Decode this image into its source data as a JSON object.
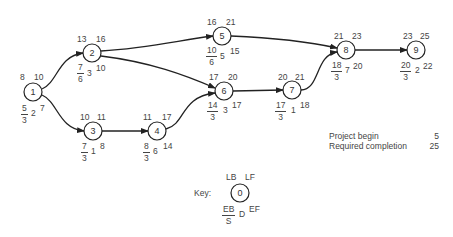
{
  "diagram": {
    "type": "activity-network",
    "nodes": [
      {
        "id": "1",
        "x": 33,
        "y": 92,
        "lb": "8",
        "lf": "10",
        "eb": "5",
        "s": "3",
        "d": "2",
        "ef": "7"
      },
      {
        "id": "2",
        "x": 92,
        "y": 53,
        "lb": "13",
        "lf": "16",
        "eb": "7",
        "s": "6",
        "d": "3",
        "ef": "10"
      },
      {
        "id": "3",
        "x": 93,
        "y": 131,
        "lb": "10",
        "lf": "11",
        "eb": "7",
        "s": "3",
        "d": "1",
        "ef": "8"
      },
      {
        "id": "4",
        "x": 157,
        "y": 131,
        "lb": "11",
        "lf": "17",
        "eb": "8",
        "s": "3",
        "d": "6",
        "ef": "14"
      },
      {
        "id": "5",
        "x": 222,
        "y": 36,
        "lb": "16",
        "lf": "21",
        "eb": "10",
        "s": "6",
        "d": "5",
        "ef": "15"
      },
      {
        "id": "6",
        "x": 224,
        "y": 91,
        "lb": "17",
        "lf": "20",
        "eb": "14",
        "s": "3",
        "d": "3",
        "ef": "17"
      },
      {
        "id": "7",
        "x": 292,
        "y": 90,
        "lb": "20",
        "lf": "21",
        "eb": "17",
        "s": "3",
        "d": "1",
        "ef": "18"
      },
      {
        "id": "8",
        "x": 346,
        "y": 50,
        "lb": "21",
        "lf": "23",
        "eb": "18",
        "s": "3",
        "d": "2",
        "ef": "20"
      },
      {
        "id": "9",
        "x": 416,
        "y": 50,
        "lb": "23",
        "lf": "25",
        "eb": "20",
        "s": "3",
        "d": "2",
        "ef": "22"
      }
    ],
    "edges": [
      {
        "from": "1",
        "to": "2"
      },
      {
        "from": "1",
        "to": "3"
      },
      {
        "from": "2",
        "to": "5"
      },
      {
        "from": "2",
        "to": "6"
      },
      {
        "from": "3",
        "to": "4"
      },
      {
        "from": "4",
        "to": "6"
      },
      {
        "from": "6",
        "to": "7"
      },
      {
        "from": "5",
        "to": "8"
      },
      {
        "from": "7",
        "to": "8"
      },
      {
        "from": "8",
        "to": "9"
      }
    ]
  },
  "node_values": {
    "n1": {
      "id": "1",
      "lb": "8",
      "lf": "10",
      "eb": "5",
      "s": "3",
      "d": "2",
      "ef": "7"
    },
    "n2": {
      "id": "2",
      "lb": "13",
      "lf": "16",
      "eb": "7",
      "s": "6",
      "d": "3",
      "ef": "10"
    },
    "n3": {
      "id": "3",
      "lb": "10",
      "lf": "11",
      "eb": "7",
      "s": "3",
      "d": "1",
      "ef": "8"
    },
    "n4": {
      "id": "4",
      "lb": "11",
      "lf": "17",
      "eb": "8",
      "s": "3",
      "d": "6",
      "ef": "14"
    },
    "n5": {
      "id": "5",
      "lb": "16",
      "lf": "21",
      "eb": "10",
      "s": "6",
      "d": "5",
      "ef": "15"
    },
    "n6": {
      "id": "6",
      "lb": "17",
      "lf": "20",
      "eb": "14",
      "s": "3",
      "d": "3",
      "ef": "17"
    },
    "n7": {
      "id": "7",
      "lb": "20",
      "lf": "21",
      "eb": "17",
      "s": "3",
      "d": "1",
      "ef": "18"
    },
    "n8": {
      "id": "8",
      "lb": "21",
      "lf": "23",
      "eb": "18",
      "s": "3",
      "d": "7",
      "ef": "20"
    },
    "n9": {
      "id": "9",
      "lb": "23",
      "lf": "25",
      "eb": "20",
      "s": "3",
      "d": "2",
      "ef": "22"
    }
  },
  "project_info": {
    "begin_label": "Project begin",
    "begin_value": "5",
    "completion_label": "Required completion",
    "completion_value": "25"
  },
  "key": {
    "title": "Key:",
    "node_id": "0",
    "lb": "LB",
    "lf": "LF",
    "eb": "EB",
    "s": "S",
    "d": "D",
    "ef": "EF"
  },
  "colors": {
    "line": "#222222",
    "text": "#444444",
    "background": "#ffffff"
  }
}
